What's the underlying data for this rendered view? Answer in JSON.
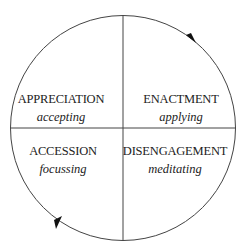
{
  "diagram": {
    "type": "cycle",
    "quadrants": [
      {
        "position": "top-left",
        "title": "APPRECIATION",
        "subtitle": "accepting"
      },
      {
        "position": "top-right",
        "title": "ENACTMENT",
        "subtitle": "applying"
      },
      {
        "position": "bottom-left",
        "title": "ACCESSION",
        "subtitle": "focussing"
      },
      {
        "position": "bottom-right",
        "title": "DISENGAGEMENT",
        "subtitle": "meditating"
      }
    ],
    "arrows": [
      {
        "location": "upper-right arc",
        "direction": "clockwise"
      },
      {
        "location": "lower-left arc",
        "direction": "clockwise"
      }
    ],
    "colors": {
      "stroke": "#333333",
      "background": "#ffffff"
    }
  }
}
